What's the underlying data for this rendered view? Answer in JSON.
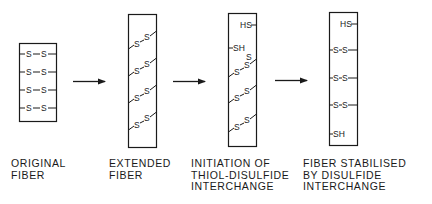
{
  "diagram": {
    "stages": [
      {
        "id": "original",
        "label_lines": [
          "ORIGINAL",
          "FIBER"
        ],
        "bonds": [
          "-S—S-",
          "-S—S-",
          "-S—S-",
          "-S—S-"
        ]
      },
      {
        "id": "extended",
        "label_lines": [
          "EXTENDED",
          "FIBER"
        ],
        "bonds": [
          "S-S",
          "S-S",
          "S-S",
          "S-S"
        ]
      },
      {
        "id": "initiation",
        "label_lines": [
          "INITIATION OF",
          "THIOL-DISULFIDE",
          "INTERCHANGE"
        ],
        "groups": [
          "HS",
          "SH"
        ],
        "bonds": [
          "S-S",
          "S-S",
          "S-S",
          "S-S"
        ]
      },
      {
        "id": "stabilised",
        "label_lines": [
          "FIBER STABILISED",
          "BY DISULFIDE",
          "INTERCHANGE"
        ],
        "groups": [
          "HS",
          "SH"
        ],
        "bonds": [
          "S-S",
          "S-S",
          "S-S"
        ]
      }
    ],
    "arrows": [
      "right-arrow",
      "right-arrow",
      "right-arrow"
    ],
    "symbols": {
      "sulfur": "S",
      "thiol_left": "HS",
      "thiol_right": "SH"
    },
    "colors": {
      "ink": "#1a1a1a",
      "background": "#ffffff"
    }
  }
}
